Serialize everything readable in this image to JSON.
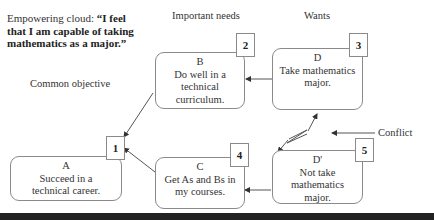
{
  "headings": {
    "empowering_prefix": "Empowering cloud: ",
    "empowering_quote": "“I feel that I am capable of taking mathematics as a major.”",
    "common_objective": "Common objective",
    "important_needs": "Important needs",
    "wants": "Wants",
    "conflict": "Conflict"
  },
  "boxes": {
    "A": {
      "letter": "A",
      "text": "Succeed in a technical career.",
      "number": "1"
    },
    "B": {
      "letter": "B",
      "text": "Do well in a technical curriculum.",
      "number": "2"
    },
    "D": {
      "letter": "D",
      "text": "Take mathematics major.",
      "number": "3"
    },
    "C": {
      "letter": "C",
      "text": "Get As and Bs in my courses.",
      "number": "4"
    },
    "D_prime": {
      "letter": "D'",
      "text": "Not take mathematics major.",
      "number": "5"
    }
  },
  "colors": {
    "line": "#555555",
    "border": "#8a8a8a",
    "bottom_bar": "#222222"
  }
}
